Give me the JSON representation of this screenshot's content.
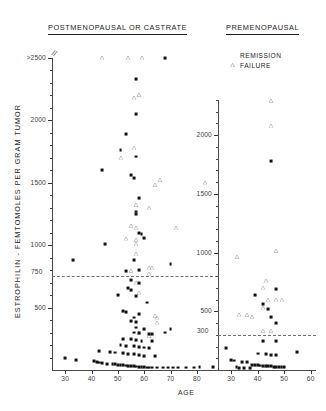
{
  "figure": {
    "y_axis_title": "ESTROPHILIN - FEMTOMOLES PER GRAM TUMOR",
    "x_axis_title": "AGE"
  },
  "legend": {
    "items": [
      {
        "label": "REMISSION",
        "marker": "triangle-open"
      },
      {
        "label": "FAILURE",
        "marker": "square-filled"
      }
    ]
  },
  "chart_data": [
    {
      "type": "scatter",
      "panel": "left",
      "title": "POSTMENOPAUSAL OR CASTRATE",
      "xlabel": "AGE",
      "ylabel": "ESTROPHILIN - FEMTOMOLES PER GRAM TUMOR",
      "xlim": [
        25,
        88
      ],
      "ylim": [
        0,
        2500
      ],
      "xticks": [
        30,
        40,
        50,
        60,
        70,
        80
      ],
      "yticks": [
        500,
        1000,
        1500,
        2000,
        2500
      ],
      "ytick_labels": [
        "500",
        "1000",
        "1500",
        "2000",
        ">2500"
      ],
      "y_axis_top_is_clipped": true,
      "grid": false,
      "threshold": {
        "value": 750,
        "label": "750",
        "style": "dashed"
      },
      "series": [
        {
          "name": "REMISSION",
          "marker": "triangle-open",
          "points": [
            [
              44,
              2500
            ],
            [
              54,
              2500
            ],
            [
              59,
              2500
            ],
            [
              56,
              2180
            ],
            [
              58,
              2200
            ],
            [
              56,
              1780
            ],
            [
              51,
              1700
            ],
            [
              66,
              1520
            ],
            [
              64,
              1480
            ],
            [
              83,
              1500
            ],
            [
              57,
              1320
            ],
            [
              62,
              1300
            ],
            [
              55,
              1150
            ],
            [
              57,
              1140
            ],
            [
              72,
              1140
            ],
            [
              53,
              1050
            ],
            [
              57,
              1040
            ],
            [
              57,
              1010
            ],
            [
              57,
              930
            ],
            [
              62,
              820
            ],
            [
              63,
              820
            ],
            [
              55,
              790
            ],
            [
              62,
              770
            ],
            [
              57,
              700
            ],
            [
              58,
              620
            ],
            [
              64,
              430
            ],
            [
              65,
              420
            ],
            [
              65,
              380
            ],
            [
              58,
              300
            ],
            [
              62,
              270
            ]
          ]
        },
        {
          "name": "FAILURE",
          "marker": "square-filled",
          "points": [
            [
              68,
              2500
            ],
            [
              57,
              2330
            ],
            [
              57,
              2050
            ],
            [
              53,
              1890
            ],
            [
              51,
              1760
            ],
            [
              57,
              1710
            ],
            [
              44,
              1600
            ],
            [
              55,
              1560
            ],
            [
              56,
              1540
            ],
            [
              58,
              1380
            ],
            [
              57,
              1270
            ],
            [
              57,
              1250
            ],
            [
              58,
              1100
            ],
            [
              59,
              1090
            ],
            [
              60,
              1060
            ],
            [
              45,
              1010
            ],
            [
              33,
              880
            ],
            [
              56,
              880
            ],
            [
              70,
              850
            ],
            [
              53,
              790
            ],
            [
              58,
              800
            ],
            [
              55,
              720
            ],
            [
              58,
              700
            ],
            [
              54,
              660
            ],
            [
              55,
              640
            ],
            [
              50,
              600
            ],
            [
              57,
              590
            ],
            [
              61,
              540
            ],
            [
              52,
              470
            ],
            [
              53,
              465
            ],
            [
              58,
              450
            ],
            [
              56,
              420
            ],
            [
              55,
              390
            ],
            [
              57,
              385
            ],
            [
              57,
              340
            ],
            [
              60,
              330
            ],
            [
              70,
              330
            ],
            [
              56,
              300
            ],
            [
              58,
              295
            ],
            [
              62,
              290
            ],
            [
              63,
              285
            ],
            [
              52,
              250
            ],
            [
              55,
              245
            ],
            [
              57,
              240
            ],
            [
              59,
              235
            ],
            [
              63,
              230
            ],
            [
              68,
              300
            ],
            [
              51,
              200
            ],
            [
              53,
              195
            ],
            [
              56,
              190
            ],
            [
              58,
              185
            ],
            [
              60,
              180
            ],
            [
              62,
              175
            ],
            [
              43,
              150
            ],
            [
              47,
              145
            ],
            [
              49,
              140
            ],
            [
              52,
              135
            ],
            [
              54,
              130
            ],
            [
              56,
              125
            ],
            [
              58,
              120
            ],
            [
              60,
              115
            ],
            [
              64,
              110
            ],
            [
              30,
              95
            ],
            [
              34,
              80
            ],
            [
              41,
              70
            ],
            [
              42,
              65
            ],
            [
              43,
              60
            ],
            [
              44,
              55
            ],
            [
              46,
              50
            ],
            [
              48,
              48
            ],
            [
              49,
              45
            ],
            [
              50,
              42
            ],
            [
              51,
              40
            ],
            [
              52,
              38
            ],
            [
              53,
              36
            ],
            [
              54,
              34
            ],
            [
              55,
              32
            ],
            [
              56,
              30
            ],
            [
              57,
              28
            ],
            [
              58,
              26
            ],
            [
              59,
              24
            ],
            [
              60,
              22
            ],
            [
              61,
              20
            ],
            [
              62,
              20
            ],
            [
              63,
              20
            ],
            [
              65,
              20
            ],
            [
              67,
              20
            ],
            [
              69,
              20
            ],
            [
              71,
              20
            ],
            [
              73,
              20
            ],
            [
              76,
              20
            ],
            [
              79,
              20
            ],
            [
              81,
              22
            ],
            [
              86,
              22
            ]
          ]
        }
      ]
    },
    {
      "type": "scatter",
      "panel": "right",
      "title": "PREMENOPAUSAL",
      "xlabel": "AGE",
      "xlim": [
        25,
        62
      ],
      "ylim": [
        0,
        2300
      ],
      "xticks": [
        30,
        40,
        50,
        60
      ],
      "yticks": [
        500,
        1000,
        1500,
        2000
      ],
      "ytick_labels": [
        "500",
        "1000",
        "1500",
        "2000"
      ],
      "grid": false,
      "threshold": {
        "value": 300,
        "label": "300",
        "style": "dashed"
      },
      "series": [
        {
          "name": "REMISSION",
          "marker": "triangle-open",
          "points": [
            [
              45,
              2290
            ],
            [
              45,
              2080
            ],
            [
              47,
              1010
            ],
            [
              32,
              960
            ],
            [
              43,
              760
            ],
            [
              42,
              700
            ],
            [
              44,
              600
            ],
            [
              47,
              600
            ],
            [
              49,
              600
            ],
            [
              42,
              530
            ],
            [
              33,
              470
            ],
            [
              36,
              465
            ],
            [
              38,
              455
            ],
            [
              42,
              330
            ],
            [
              45,
              330
            ]
          ]
        },
        {
          "name": "FAILURE",
          "marker": "square-filled",
          "points": [
            [
              45,
              1780
            ],
            [
              47,
              690
            ],
            [
              39,
              640
            ],
            [
              42,
              560
            ],
            [
              44,
              520
            ],
            [
              45,
              450
            ],
            [
              47,
              400
            ],
            [
              42,
              250
            ],
            [
              47,
              250
            ],
            [
              28,
              190
            ],
            [
              40,
              140
            ],
            [
              43,
              135
            ],
            [
              45,
              130
            ],
            [
              47,
              125
            ],
            [
              55,
              150
            ],
            [
              30,
              85
            ],
            [
              31,
              80
            ],
            [
              34,
              70
            ],
            [
              36,
              65
            ],
            [
              38,
              45
            ],
            [
              39,
              42
            ],
            [
              40,
              40
            ],
            [
              41,
              38
            ],
            [
              42,
              36
            ],
            [
              43,
              34
            ],
            [
              44,
              32
            ],
            [
              45,
              30
            ],
            [
              46,
              28
            ],
            [
              47,
              26
            ],
            [
              48,
              24
            ],
            [
              49,
              22
            ],
            [
              50,
              22
            ],
            [
              32,
              22
            ],
            [
              33,
              20
            ],
            [
              35,
              20
            ],
            [
              37,
              20
            ]
          ]
        }
      ]
    }
  ]
}
